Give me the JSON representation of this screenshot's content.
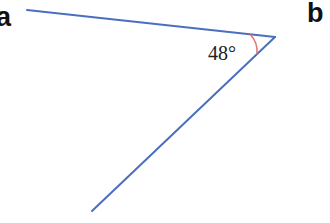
{
  "panels": {
    "left_label": "a",
    "right_label": "b"
  },
  "angle": {
    "value_label": "48°",
    "degrees": 48
  },
  "colors": {
    "line": "#4a6fbf",
    "arc": "#e8706a",
    "text": "#222222"
  },
  "geometry": {
    "vertex": [
      275,
      37
    ],
    "ray1_end": [
      27,
      10
    ],
    "ray2_end": [
      92,
      211
    ]
  }
}
